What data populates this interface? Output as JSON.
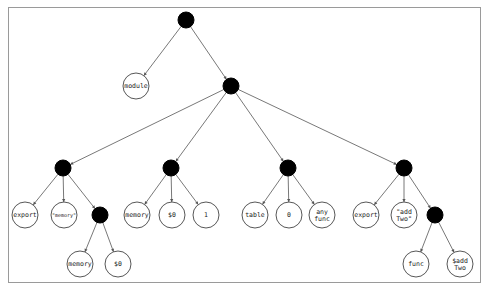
{
  "diagram": {
    "type": "tree",
    "frame": {
      "x": 8,
      "y": 7,
      "width": 472,
      "height": 275
    },
    "inner_node_radius": 8,
    "leaf_node_radius": 13,
    "colors": {
      "inner_fill": "#000000",
      "leaf_fill": "#ffffff",
      "leaf_stroke": "#444444",
      "edge": "#555555",
      "frame": "#9a9a9a"
    },
    "nodes": [
      {
        "id": "root",
        "kind": "inner",
        "x": 186,
        "y": 20,
        "label": ""
      },
      {
        "id": "module",
        "kind": "leaf",
        "x": 136,
        "y": 86,
        "label": "module"
      },
      {
        "id": "body",
        "kind": "inner",
        "x": 231,
        "y": 86,
        "label": ""
      },
      {
        "id": "export1",
        "kind": "inner",
        "x": 63,
        "y": 168,
        "label": ""
      },
      {
        "id": "export1_kw",
        "kind": "leaf",
        "x": 25,
        "y": 215,
        "label": "export"
      },
      {
        "id": "export1_name",
        "kind": "leaf",
        "x": 64,
        "y": 215,
        "label": "\"memory\"",
        "small": true
      },
      {
        "id": "export1_desc",
        "kind": "inner",
        "x": 100,
        "y": 215,
        "label": ""
      },
      {
        "id": "export1_desc_kw",
        "kind": "leaf",
        "x": 80,
        "y": 264,
        "label": "memory"
      },
      {
        "id": "export1_desc_id",
        "kind": "leaf",
        "x": 118,
        "y": 264,
        "label": "$0"
      },
      {
        "id": "memory",
        "kind": "inner",
        "x": 171,
        "y": 168,
        "label": ""
      },
      {
        "id": "memory_kw",
        "kind": "leaf",
        "x": 137,
        "y": 215,
        "label": "memory"
      },
      {
        "id": "memory_id",
        "kind": "leaf",
        "x": 172,
        "y": 215,
        "label": "$0"
      },
      {
        "id": "memory_size",
        "kind": "leaf",
        "x": 206,
        "y": 215,
        "label": "1"
      },
      {
        "id": "table",
        "kind": "inner",
        "x": 288,
        "y": 168,
        "label": ""
      },
      {
        "id": "table_kw",
        "kind": "leaf",
        "x": 255,
        "y": 215,
        "label": "table"
      },
      {
        "id": "table_size",
        "kind": "leaf",
        "x": 289,
        "y": 215,
        "label": "0"
      },
      {
        "id": "table_type",
        "kind": "leaf",
        "x": 322,
        "y": 215,
        "label": "any\nfunc"
      },
      {
        "id": "export2",
        "kind": "inner",
        "x": 404,
        "y": 168,
        "label": ""
      },
      {
        "id": "export2_kw",
        "kind": "leaf",
        "x": 366,
        "y": 215,
        "label": "export"
      },
      {
        "id": "export2_name",
        "kind": "leaf",
        "x": 404,
        "y": 215,
        "label": "\"add\nTwo\""
      },
      {
        "id": "export2_desc",
        "kind": "inner",
        "x": 435,
        "y": 215,
        "label": ""
      },
      {
        "id": "export2_desc_kw",
        "kind": "leaf",
        "x": 416,
        "y": 264,
        "label": "func"
      },
      {
        "id": "export2_desc_id",
        "kind": "leaf",
        "x": 460,
        "y": 264,
        "label": "$add\nTwo"
      }
    ],
    "edges": [
      [
        "root",
        "module"
      ],
      [
        "root",
        "body"
      ],
      [
        "body",
        "export1"
      ],
      [
        "body",
        "memory"
      ],
      [
        "body",
        "table"
      ],
      [
        "body",
        "export2"
      ],
      [
        "export1",
        "export1_kw"
      ],
      [
        "export1",
        "export1_name"
      ],
      [
        "export1",
        "export1_desc"
      ],
      [
        "export1_desc",
        "export1_desc_kw"
      ],
      [
        "export1_desc",
        "export1_desc_id"
      ],
      [
        "memory",
        "memory_kw"
      ],
      [
        "memory",
        "memory_id"
      ],
      [
        "memory",
        "memory_size"
      ],
      [
        "table",
        "table_kw"
      ],
      [
        "table",
        "table_size"
      ],
      [
        "table",
        "table_type"
      ],
      [
        "export2",
        "export2_kw"
      ],
      [
        "export2",
        "export2_name"
      ],
      [
        "export2",
        "export2_desc"
      ],
      [
        "export2_desc",
        "export2_desc_kw"
      ],
      [
        "export2_desc",
        "export2_desc_id"
      ]
    ]
  }
}
